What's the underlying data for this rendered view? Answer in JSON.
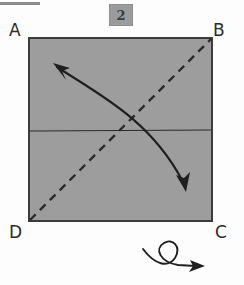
{
  "diagram": {
    "kind": "origami-fold-step",
    "step_number": "2",
    "sheet": {
      "shape": "square",
      "fill_color": "#9d9d9d",
      "border_color": "#3c3c3c"
    },
    "corner_labels": {
      "top_left": "A",
      "top_right": "B",
      "bottom_right": "C",
      "bottom_left": "D"
    },
    "fold_lines": [
      {
        "name": "diagonal-fold-line",
        "style": "dashed",
        "from": "D",
        "to": "B",
        "color": "#2b2b2b"
      },
      {
        "name": "horizontal-crease-line",
        "style": "solid",
        "from": "left-edge-midpoint",
        "to": "right-edge-midpoint",
        "color": "#2b2b2b"
      }
    ],
    "arrows": [
      {
        "name": "fold-direction-arrow",
        "style": "curved-double-headed",
        "head_start": "upper-left",
        "head_end": "lower-right",
        "color": "#1f1f1f"
      },
      {
        "name": "turn-over-arrow",
        "style": "looped-flip-symbol",
        "direction": "right",
        "color": "#1f1f1f"
      }
    ],
    "top_rule": {
      "name": "page-rule-mark",
      "color": "#8d8d8d"
    }
  }
}
